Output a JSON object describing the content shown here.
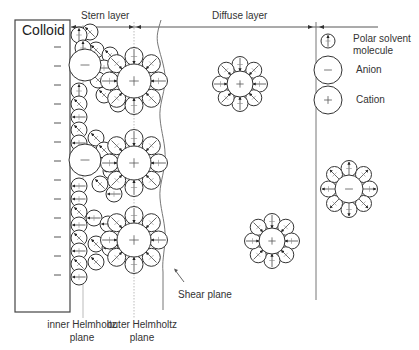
{
  "labels": {
    "colloid": "Colloid",
    "stern_layer": "Stern layer",
    "diffuse_layer": "Diffuse layer",
    "shear_plane": "Shear plane",
    "inner_helmholtz_line1": "inner Helmholtz",
    "inner_helmholtz_line2": "plane",
    "outer_helmholtz_line1": "outer Helmholtz",
    "outer_helmholtz_line2": "plane"
  },
  "legend": {
    "items": [
      {
        "icon": "polar-solvent-molecule-icon",
        "label_line1": "Polar solvent",
        "label_line2": "molecule"
      },
      {
        "icon": "anion-icon",
        "label_line1": "Anion",
        "symbol": "−"
      },
      {
        "icon": "cation-icon",
        "label_line1": "Cation",
        "symbol": "+"
      }
    ]
  },
  "surface_charges": {
    "symbol": "−",
    "count": 13
  },
  "colors": {
    "stroke": "#333333",
    "light_line": "#999999",
    "text": "#333333",
    "background": "#ffffff"
  }
}
